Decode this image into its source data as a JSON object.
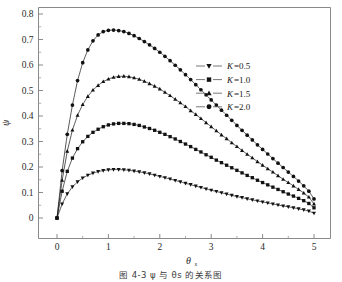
{
  "figure": {
    "caption": "图 4-3    ψ 与 θs 的关系图"
  },
  "axes": {
    "x_title": "θ",
    "x_subscript": "s",
    "y_title": "ψ",
    "x_ticklabels": [
      "0",
      "1",
      "2",
      "3",
      "4",
      "5"
    ],
    "y_ticklabels": [
      "0",
      "0.1",
      "0.2",
      "0.3",
      "0.4",
      "0.5",
      "0.6",
      "0.7",
      "0.8"
    ]
  },
  "legend": {
    "items": [
      {
        "label": "K=0.5",
        "var": "K",
        "value": "=0.5",
        "marker": "triangle-down"
      },
      {
        "label": "K=1.0",
        "var": "K",
        "value": "=1.0",
        "marker": "square"
      },
      {
        "label": "K=1.5",
        "var": "K",
        "value": "=1.5",
        "marker": "triangle-up"
      },
      {
        "label": "K=2.0",
        "var": "K",
        "value": "=2.0",
        "marker": "circle"
      }
    ]
  },
  "chart_data": {
    "type": "line",
    "title": "",
    "xlabel": "θs",
    "ylabel": "ψ",
    "xlim": [
      0,
      5
    ],
    "ylim": [
      0,
      0.8
    ],
    "xticks": [
      0,
      1,
      2,
      3,
      4,
      5
    ],
    "yticks": [
      0,
      0.1,
      0.2,
      0.3,
      0.4,
      0.5,
      0.6,
      0.7,
      0.8
    ],
    "minor_xticks": [
      0.5,
      1.5,
      2.5,
      3.5,
      4.5
    ],
    "minor_yticks": [
      0.05,
      0.15,
      0.25,
      0.35,
      0.45,
      0.55,
      0.65,
      0.75
    ],
    "grid": false,
    "legend_position": "upper right",
    "marker_color": "#111111",
    "line_color": "#111111",
    "x": [
      0,
      0.1,
      0.2,
      0.3,
      0.4,
      0.5,
      0.6,
      0.7,
      0.8,
      0.9,
      1.0,
      1.1,
      1.2,
      1.3,
      1.4,
      1.5,
      1.6,
      1.7,
      1.8,
      1.9,
      2.0,
      2.1,
      2.2,
      2.3,
      2.4,
      2.5,
      2.6,
      2.7,
      2.8,
      2.9,
      3.0,
      3.1,
      3.2,
      3.3,
      3.4,
      3.5,
      3.6,
      3.7,
      3.8,
      3.9,
      4.0,
      4.1,
      4.2,
      4.3,
      4.4,
      4.5,
      4.6,
      4.7,
      4.8,
      4.9,
      5.0
    ],
    "series": [
      {
        "name": "K=0.5",
        "marker": "triangle-down",
        "values": [
          0.0,
          0.055,
          0.095,
          0.122,
          0.142,
          0.157,
          0.168,
          0.176,
          0.182,
          0.186,
          0.189,
          0.19,
          0.19,
          0.189,
          0.187,
          0.184,
          0.181,
          0.177,
          0.173,
          0.168,
          0.163,
          0.158,
          0.153,
          0.147,
          0.142,
          0.136,
          0.131,
          0.125,
          0.12,
          0.114,
          0.109,
          0.104,
          0.099,
          0.094,
          0.089,
          0.084,
          0.08,
          0.075,
          0.071,
          0.067,
          0.063,
          0.059,
          0.055,
          0.051,
          0.047,
          0.044,
          0.04,
          0.036,
          0.032,
          0.027,
          0.019
        ],
        "peak": {
          "x": 1.1,
          "y": 0.19
        },
        "endpoint": {
          "x": 5.0,
          "y": 0.019
        }
      },
      {
        "name": "K=1.0",
        "marker": "square",
        "values": [
          0.0,
          0.105,
          0.183,
          0.235,
          0.272,
          0.299,
          0.32,
          0.336,
          0.348,
          0.358,
          0.365,
          0.369,
          0.371,
          0.371,
          0.37,
          0.367,
          0.363,
          0.357,
          0.351,
          0.344,
          0.336,
          0.328,
          0.319,
          0.31,
          0.3,
          0.29,
          0.28,
          0.269,
          0.259,
          0.248,
          0.238,
          0.227,
          0.217,
          0.207,
          0.197,
          0.187,
          0.177,
          0.167,
          0.158,
          0.148,
          0.139,
          0.13,
          0.121,
          0.112,
          0.103,
          0.094,
          0.086,
          0.077,
          0.068,
          0.057,
          0.04
        ],
        "peak": {
          "x": 1.2,
          "y": 0.371
        },
        "endpoint": {
          "x": 5.0,
          "y": 0.04
        }
      },
      {
        "name": "K=1.5",
        "marker": "triangle-up",
        "values": [
          0.0,
          0.148,
          0.262,
          0.345,
          0.403,
          0.445,
          0.477,
          0.502,
          0.52,
          0.535,
          0.545,
          0.552,
          0.555,
          0.556,
          0.554,
          0.55,
          0.544,
          0.536,
          0.527,
          0.517,
          0.506,
          0.493,
          0.48,
          0.466,
          0.452,
          0.437,
          0.421,
          0.406,
          0.39,
          0.374,
          0.358,
          0.342,
          0.326,
          0.311,
          0.295,
          0.28,
          0.265,
          0.25,
          0.236,
          0.221,
          0.207,
          0.193,
          0.18,
          0.166,
          0.152,
          0.139,
          0.126,
          0.112,
          0.098,
          0.082,
          0.055
        ],
        "peak": {
          "x": 1.3,
          "y": 0.556
        },
        "endpoint": {
          "x": 5.0,
          "y": 0.055
        }
      },
      {
        "name": "K=2.0",
        "marker": "circle",
        "values": [
          0.0,
          0.186,
          0.328,
          0.443,
          0.539,
          0.609,
          0.659,
          0.695,
          0.718,
          0.731,
          0.736,
          0.737,
          0.735,
          0.731,
          0.724,
          0.715,
          0.704,
          0.692,
          0.679,
          0.665,
          0.65,
          0.634,
          0.617,
          0.599,
          0.581,
          0.562,
          0.543,
          0.523,
          0.503,
          0.483,
          0.463,
          0.443,
          0.423,
          0.403,
          0.383,
          0.363,
          0.344,
          0.325,
          0.306,
          0.287,
          0.269,
          0.251,
          0.233,
          0.215,
          0.198,
          0.18,
          0.163,
          0.145,
          0.126,
          0.105,
          0.075
        ],
        "peak": {
          "x": 1.1,
          "y": 0.737
        },
        "endpoint": {
          "x": 5.0,
          "y": 0.075
        }
      }
    ]
  }
}
